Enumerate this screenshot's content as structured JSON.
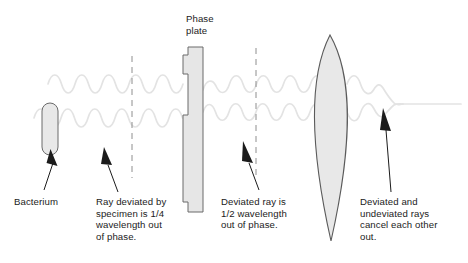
{
  "figure": {
    "background_color": "#ffffff",
    "text_color": "#1b1b1b",
    "wave_color": "#e2e2e2",
    "outline_color": "#555555",
    "fill_color": "#e8e8e8",
    "leader_color": "#1b1b1b",
    "dash_color": "#888888"
  },
  "labels": {
    "phase_plate": "Phase\nplate",
    "bacterium": "Bacterium",
    "ray_deviated": "Ray deviated by\nspecimen is 1/4\nwavelength out\nof phase.",
    "deviated_half": "Deviated ray is\n1/2 wavelength\nout of phase.",
    "cancel": "Deviated and\nundeviated rays\ncancel each other\nout."
  },
  "elements": {
    "bacterium_shape": "capsule",
    "phase_plate_shape": "notched-vertical-plate",
    "lens_shape": "biconvex-lens",
    "undeviated_wave": "top-sine-wave",
    "deviated_wave": "bottom-sine-wave",
    "output_ray": "flat-cancelled-line",
    "dashed_line_left": "phase-reference-1",
    "dashed_line_right": "phase-reference-2"
  }
}
